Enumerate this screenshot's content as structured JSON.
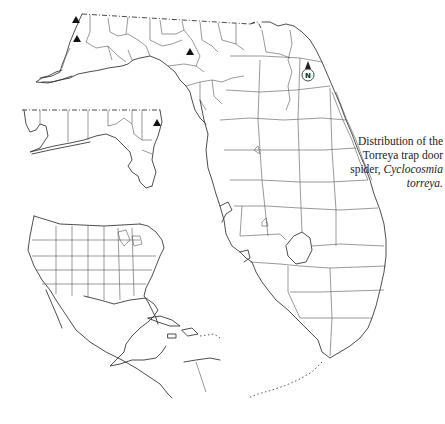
{
  "figure": {
    "caption_line1": "Distribution of the",
    "caption_line2": "Torreya trap door",
    "caption_line3_prefix": "spider, ",
    "caption_species_genus": "Cyclocosmia",
    "caption_species_epithet": "torreya.",
    "north_arrow_label": "N"
  },
  "map": {
    "main_region": "Florida (counties)",
    "inset_top": "Florida panhandle enlargement",
    "inset_bottom_left": "North America locator map",
    "markers": [
      {
        "shape": "triangle",
        "inset": "panhandle",
        "x": 76,
        "y": 21
      },
      {
        "shape": "triangle",
        "inset": "panhandle",
        "x": 77,
        "y": 40
      },
      {
        "shape": "triangle",
        "inset": "panhandle",
        "x": 190,
        "y": 53
      },
      {
        "shape": "triangle",
        "inset": "panhandle-lower",
        "x": 157,
        "y": 124
      }
    ],
    "colors": {
      "background": "#ffffff",
      "outline": "#3a3a3a",
      "marker": "#111111"
    }
  }
}
